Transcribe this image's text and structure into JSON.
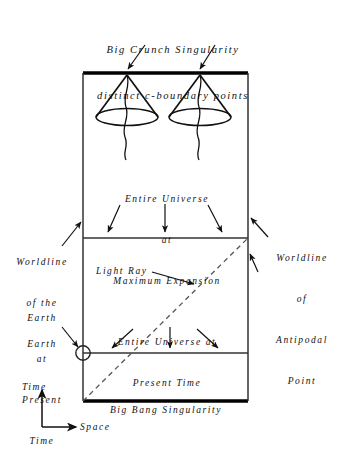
{
  "figure": {
    "kind": "spacetime-diagram",
    "captions": {
      "top_line1": "Big Crunch Singularity",
      "top_line2": "distinct c-boundary points",
      "max_expansion_line1": "Entire Universe",
      "max_expansion_line2": "at",
      "max_expansion_line3": "Maximum Expansion",
      "present_time_line1": "Entire Universe at",
      "present_time_line2": "Present Time",
      "big_bang": "Big Bang Singularity",
      "light_ray": "Light Ray",
      "worldline_earth_line1": "Worldline",
      "worldline_earth_line2": "of the",
      "worldline_earth_line3": "Earth",
      "earth_present_line1": "Earth",
      "earth_present_line2": "at",
      "earth_present_line3": "Present",
      "earth_present_line4": "Time",
      "worldline_antipodal_line1": "Worldline",
      "worldline_antipodal_line2": "of",
      "worldline_antipodal_line3": "Antipodal",
      "worldline_antipodal_line4": "Point",
      "axis_time": "Time",
      "axis_space": "Space"
    },
    "colors": {
      "ink": "#111111",
      "paper": "#ffffff",
      "singularity": "#000000",
      "dashed_ray": "#555555"
    },
    "geometry": {
      "box_left": 83,
      "box_right": 248,
      "box_top": 73,
      "box_bottom": 401,
      "divider_max_expansion_y": 238,
      "divider_present_y": 353,
      "earth_marker_x": 83,
      "earth_marker_y": 353,
      "cone_one_apex_x": 127,
      "cone_two_apex_x": 200,
      "cone_apex_y": 75,
      "cone_base_y": 117,
      "cone_half_width": 31
    }
  }
}
